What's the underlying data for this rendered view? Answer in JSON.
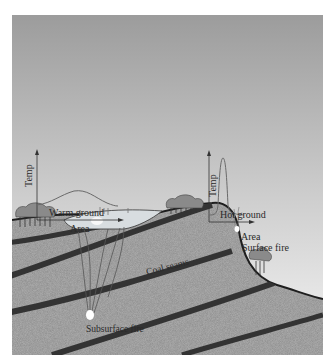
{
  "figure": {
    "colors": {
      "sky_top": "#9a9a9a",
      "sky_bottom": "#f2f2f2",
      "ground": "#a8a8a8",
      "coal_seam": "#3a3a3a",
      "outline": "#1e1e1e",
      "curve": "#6a6a6a",
      "text": "#2a2a2a"
    },
    "left_chart": {
      "y_axis_label": "Temp",
      "curve_label": "Warm ground",
      "x_axis_label": "Area"
    },
    "right_chart": {
      "y_axis_label": "Temp",
      "curve_label": "Hot ground",
      "x_axis_label": "Area"
    },
    "labels": {
      "surface_fire": "Surface fire",
      "coal_seams": "Coal seams",
      "subsurface_fire": "Subsurface fire"
    }
  }
}
